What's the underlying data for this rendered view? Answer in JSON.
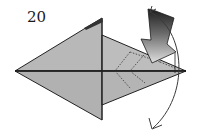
{
  "diagram": {
    "type": "origami-step",
    "step_number": "20",
    "colors": {
      "paper": "#b3b3b3",
      "paper_light": "#c4c4c4",
      "outline": "#222222",
      "arrow_dark": "#2a2a2a",
      "arrow_light": "#d8d8d8",
      "background": "#ffffff"
    },
    "elements": [
      {
        "name": "folded-model",
        "description": "Diamond/kite shaped folded paper with center crease"
      },
      {
        "name": "valley-fold-lines",
        "description": "Dotted fold lines on right flap"
      },
      {
        "name": "push-arrow",
        "description": "Gradient hollow arrow pointing into the model (sink/push)"
      },
      {
        "name": "rotate-arrow",
        "description": "Curved arrow indicating fold down/behind"
      }
    ]
  }
}
